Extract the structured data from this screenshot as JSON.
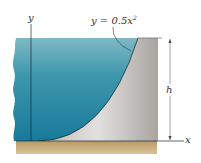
{
  "diagram": {
    "labels": {
      "y_axis": "y",
      "x_axis": "x",
      "height": "h",
      "equation_lhs": "y = 0.5x",
      "equation_exp": "2"
    },
    "colors": {
      "water_top": "#7fb8c4",
      "water_bottom": "#1f7d9a",
      "wall": "#c8c4c0",
      "wall_light": "#e4e2df",
      "ground": "#c7aa78",
      "line": "#1f2a30"
    }
  }
}
